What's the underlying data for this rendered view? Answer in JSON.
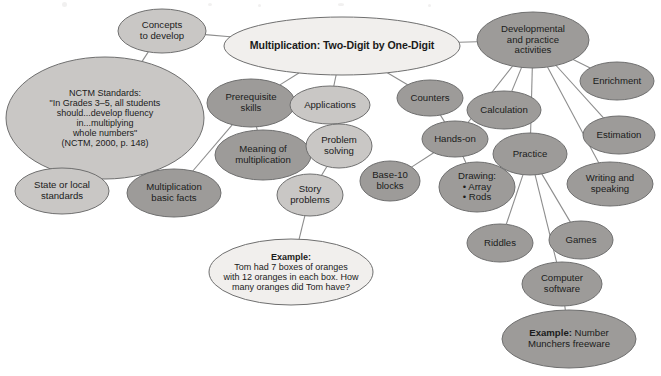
{
  "diagram": {
    "type": "concept-map",
    "palette": {
      "dark_fill": "#9d9b99",
      "mid_fill": "#c9c7c5",
      "light_fill": "#f1efed",
      "outline": "#6f6f6f",
      "edge": "#8d8d8d",
      "text": "#1b1b1b",
      "background": "#ffffff"
    },
    "nodes": [
      {
        "id": "center",
        "label": "Multiplication: Two-Digit by One-Digit",
        "shade": "light",
        "emphasis": "bold",
        "cx": 342,
        "cy": 46,
        "rx": 118,
        "ry": 29,
        "size": "lg"
      },
      {
        "id": "concepts",
        "label": "Concepts\nto develop",
        "shade": "mid",
        "cx": 162,
        "cy": 31,
        "rx": 44,
        "ry": 22,
        "size": "md"
      },
      {
        "id": "nctm",
        "label": "NCTM Standards:\n\"In Grades 3–5, all students\nshould...develop fluency\nin...multiplying\nwhole numbers\"\n(NCTM, 2000, p. 148)",
        "shade": "mid",
        "cx": 105,
        "cy": 118,
        "rx": 99,
        "ry": 61,
        "size": "sm"
      },
      {
        "id": "state",
        "label": "State or local\nstandards",
        "shade": "mid",
        "cx": 62,
        "cy": 191,
        "rx": 47,
        "ry": 23,
        "size": "md"
      },
      {
        "id": "prereq",
        "label": "Prerequisite\nskills",
        "shade": "dark",
        "cx": 251,
        "cy": 103,
        "rx": 44,
        "ry": 24,
        "size": "md"
      },
      {
        "id": "meaning",
        "label": "Meaning of\nmultiplication",
        "shade": "dark",
        "cx": 263,
        "cy": 155,
        "rx": 48,
        "ry": 25,
        "size": "md"
      },
      {
        "id": "basicfacts",
        "label": "Multiplication\nbasic facts",
        "shade": "dark",
        "cx": 174,
        "cy": 193,
        "rx": 47,
        "ry": 24,
        "size": "md"
      },
      {
        "id": "applications",
        "label": "Applications",
        "shade": "mid",
        "cx": 330,
        "cy": 105,
        "rx": 40,
        "ry": 19,
        "size": "md"
      },
      {
        "id": "problemsolving",
        "label": "Problem\nsolving",
        "shade": "mid",
        "cx": 339,
        "cy": 146,
        "rx": 33,
        "ry": 22,
        "size": "md"
      },
      {
        "id": "storyproblems",
        "label": "Story\nproblems",
        "shade": "mid",
        "cx": 310,
        "cy": 195,
        "rx": 33,
        "ry": 21,
        "size": "md"
      },
      {
        "id": "example1",
        "label": "Example:\nTom had 7 boxes of oranges\nwith 12 oranges in each box. How\nmany oranges did Tom have?",
        "shade": "light",
        "emphasis": "first-bold",
        "cx": 291,
        "cy": 272,
        "rx": 82,
        "ry": 33,
        "size": "sm"
      },
      {
        "id": "base10",
        "label": "Base-10\nblocks",
        "shade": "dark",
        "cx": 390,
        "cy": 181,
        "rx": 30,
        "ry": 20,
        "size": "md"
      },
      {
        "id": "devpractice",
        "label": "Developmental\nand practice\nactivities",
        "shade": "dark",
        "cx": 533,
        "cy": 40,
        "rx": 56,
        "ry": 28,
        "size": "md"
      },
      {
        "id": "enrichment",
        "label": "Enrichment",
        "shade": "dark",
        "cx": 617,
        "cy": 81,
        "rx": 37,
        "ry": 19,
        "size": "md"
      },
      {
        "id": "estimation",
        "label": "Estimation",
        "shade": "dark",
        "cx": 619,
        "cy": 135,
        "rx": 36,
        "ry": 19,
        "size": "md"
      },
      {
        "id": "counters",
        "label": "Counters",
        "shade": "dark",
        "cx": 430,
        "cy": 98,
        "rx": 33,
        "ry": 18,
        "size": "md"
      },
      {
        "id": "calculation",
        "label": "Calculation",
        "shade": "dark",
        "cx": 504,
        "cy": 110,
        "rx": 37,
        "ry": 19,
        "size": "md"
      },
      {
        "id": "handson",
        "label": "Hands-on",
        "shade": "dark",
        "cx": 455,
        "cy": 139,
        "rx": 33,
        "ry": 18,
        "size": "md"
      },
      {
        "id": "drawing",
        "label": "Drawing:\n• Array\n• Rods",
        "shade": "dark",
        "cx": 477,
        "cy": 187,
        "rx": 38,
        "ry": 25,
        "size": "md"
      },
      {
        "id": "practice",
        "label": "Practice",
        "shade": "dark",
        "cx": 530,
        "cy": 154,
        "rx": 37,
        "ry": 21,
        "size": "md"
      },
      {
        "id": "writingspeaking",
        "label": "Writing and\nspeaking",
        "shade": "dark",
        "cx": 610,
        "cy": 184,
        "rx": 43,
        "ry": 22,
        "size": "md"
      },
      {
        "id": "riddles",
        "label": "Riddles",
        "shade": "dark",
        "cx": 500,
        "cy": 243,
        "rx": 33,
        "ry": 19,
        "size": "md"
      },
      {
        "id": "games",
        "label": "Games",
        "shade": "dark",
        "cx": 581,
        "cy": 240,
        "rx": 32,
        "ry": 19,
        "size": "md"
      },
      {
        "id": "computersoftware",
        "label": "Computer\nsoftware",
        "shade": "dark",
        "cx": 562,
        "cy": 284,
        "rx": 40,
        "ry": 22,
        "size": "md"
      },
      {
        "id": "example2",
        "label": "Example: Number\nMunchers freeware",
        "shade": "dark",
        "emphasis": "first-bold",
        "cx": 569,
        "cy": 339,
        "rx": 67,
        "ry": 29,
        "size": "md"
      }
    ],
    "edges": [
      {
        "from": "concepts",
        "to": "center"
      },
      {
        "from": "concepts",
        "to": "nctm"
      },
      {
        "from": "nctm",
        "to": "state"
      },
      {
        "from": "center",
        "to": "prereq"
      },
      {
        "from": "center",
        "to": "applications"
      },
      {
        "from": "center",
        "to": "counters"
      },
      {
        "from": "center",
        "to": "devpractice"
      },
      {
        "from": "prereq",
        "to": "meaning"
      },
      {
        "from": "prereq",
        "to": "basicfacts"
      },
      {
        "from": "applications",
        "to": "problemsolving"
      },
      {
        "from": "problemsolving",
        "to": "storyproblems"
      },
      {
        "from": "storyproblems",
        "to": "example1"
      },
      {
        "from": "devpractice",
        "to": "enrichment"
      },
      {
        "from": "devpractice",
        "to": "estimation"
      },
      {
        "from": "devpractice",
        "to": "calculation"
      },
      {
        "from": "devpractice",
        "to": "handson"
      },
      {
        "from": "devpractice",
        "to": "practice"
      },
      {
        "from": "devpractice",
        "to": "writingspeaking"
      },
      {
        "from": "counters",
        "to": "handson"
      },
      {
        "from": "handson",
        "to": "drawing"
      },
      {
        "from": "handson",
        "to": "base10"
      },
      {
        "from": "practice",
        "to": "riddles"
      },
      {
        "from": "practice",
        "to": "games"
      },
      {
        "from": "practice",
        "to": "computersoftware"
      },
      {
        "from": "computersoftware",
        "to": "example2"
      }
    ]
  }
}
